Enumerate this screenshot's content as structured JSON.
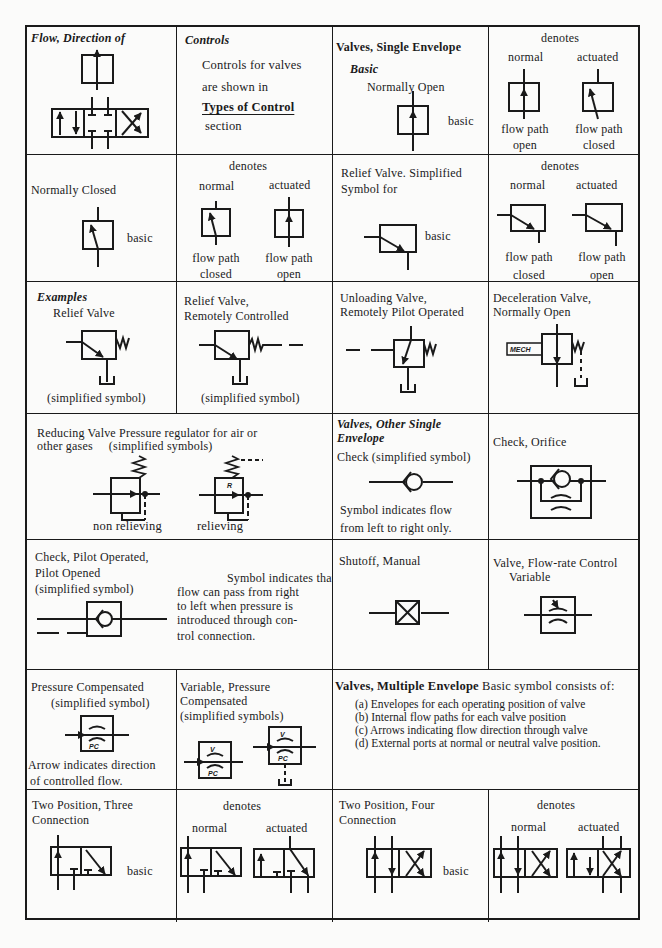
{
  "page": {
    "cells": {
      "flow_direction": {
        "title": "Flow, Direction of"
      },
      "controls": {
        "title": "Controls",
        "line1": "Controls for valves",
        "line2": "are shown in",
        "link": "Types of Control",
        "line3": "section"
      },
      "single_envelope": {
        "title": "Valves, Single Envelope",
        "subtitle": "Basic",
        "caption": "Normally Open",
        "basic_label": "basic"
      },
      "no_denotes": {
        "denotes": "denotes",
        "normal": "normal",
        "actuated": "actuated",
        "normal_caption_1": "flow path",
        "normal_caption_2": "open",
        "actuated_caption_1": "flow path",
        "actuated_caption_2": "closed"
      },
      "normally_closed": {
        "title": "Normally Closed",
        "basic_label": "basic"
      },
      "nc_denotes": {
        "denotes": "denotes",
        "normal": "normal",
        "actuated": "actuated",
        "normal_caption_1": "flow path",
        "normal_caption_2": "closed",
        "actuated_caption_1": "flow path",
        "actuated_caption_2": "open"
      },
      "relief_simplified": {
        "title_1": "Relief Valve. Simplified",
        "title_2": "Symbol for",
        "basic_label": "basic"
      },
      "relief_denotes": {
        "denotes": "denotes",
        "normal": "normal",
        "actuated": "actuated",
        "normal_caption_1": "flow path",
        "normal_caption_2": "closed",
        "actuated_caption_1": "flow path",
        "actuated_caption_2": "open"
      },
      "examples_relief": {
        "title": "Examples",
        "subtitle": "Relief Valve",
        "caption": "(simplified symbol)"
      },
      "relief_remote": {
        "title_1": "Relief Valve,",
        "title_2": "Remotely Controlled",
        "caption": "(simplified symbol)"
      },
      "unloading": {
        "title_1": "Unloading Valve,",
        "title_2": "Remotely Pilot Operated"
      },
      "deceleration": {
        "title_1": "Deceleration Valve,",
        "title_2": "Normally Open",
        "mech_label": "MECH"
      },
      "reducing": {
        "title_1": "Reducing Valve  Pressure regulator for  air or",
        "title_2": "other gases     (simplified symbols)",
        "non_relieving": "non relieving",
        "relieving": "relieving",
        "r_label": "R"
      },
      "other_single": {
        "title_1": "Valves, Other Single",
        "title_2": "Envelope",
        "caption": "Check (simplified symbol)",
        "note_1": "Symbol indicates flow",
        "note_2": "from left to right only."
      },
      "check_orifice": {
        "title": "Check, Orifice"
      },
      "check_pilot": {
        "title_1": "Check, Pilot Operated,",
        "title_2": "Pilot Opened",
        "title_3": "(simplified symbol)",
        "note_1": "Symbol indicates that",
        "note_2": "flow can pass from right",
        "note_3": "to left when pressure is",
        "note_4": "introduced through  con-",
        "note_5": "trol connection."
      },
      "shutoff": {
        "title": "Shutoff, Manual"
      },
      "flow_rate": {
        "title_1": "Valve, Flow-rate Control",
        "title_2": "Variable"
      },
      "pressure_comp": {
        "title_1": "Pressure Compensated",
        "title_2": "(simplified symbol)",
        "note_1": "Arrow indicates direction",
        "note_2": "of controlled flow.",
        "pc_label": "PC"
      },
      "variable_pc": {
        "title_1": "Variable, Pressure",
        "title_2": "Compensated",
        "title_3": "(simplified symbols)",
        "v_label": "V",
        "pc_label": "PC"
      },
      "multiple_envelope": {
        "title": "Valves, Multiple Envelope",
        "intro": " Basic symbol consists of:",
        "items": [
          "(a)  Envelopes for each operating position of valve",
          "(b) Internal flow paths for each valve position",
          "(c)  Arrows indicating flow direction through valve",
          "(d)  External ports at normal or neutral valve position."
        ]
      },
      "two_pos_three": {
        "title_1": "Two Position, Three",
        "title_2": "Connection",
        "basic_label": "basic"
      },
      "tp3_denotes": {
        "denotes": "denotes",
        "normal": "normal",
        "actuated": "actuated"
      },
      "two_pos_four": {
        "title_1": "Two Position, Four",
        "title_2": "Connection",
        "basic_label": "basic"
      },
      "tp4_denotes": {
        "denotes": "denotes",
        "normal": "normal",
        "actuated": "actuated"
      }
    }
  }
}
